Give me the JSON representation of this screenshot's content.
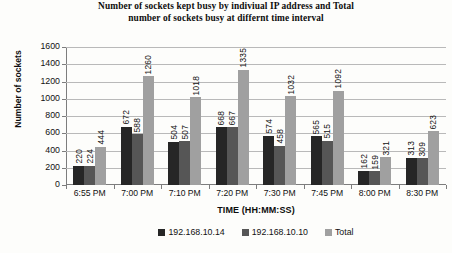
{
  "chart_data": {
    "type": "bar",
    "title": "Number of sockets kept busy by indiviual IP address and Total number of sockets busy at differnt time interval",
    "title_line1": "Number of sockets kept busy by indiviual IP address and Total",
    "title_line2": "number of sockets busy at differnt time interval",
    "xlabel": "TIME (HH:MM:SS)",
    "ylabel": "Number of sockets",
    "ylim": [
      0,
      1600
    ],
    "ytick_step": 200,
    "yticks": [
      "1600",
      "1400",
      "1200",
      "1000",
      "800",
      "600",
      "400",
      "200",
      "0"
    ],
    "grid": true,
    "legend_position": "bottom",
    "categories": [
      "6:55 PM",
      "7:00 PM",
      "7:10 PM",
      "7:20 PM",
      "7:30 PM",
      "7:45 PM",
      "8:00 PM",
      "8:30 PM"
    ],
    "series": [
      {
        "name": "192.168.10.14",
        "color": "#262626",
        "values": [
          220,
          672,
          504,
          668,
          574,
          565,
          162,
          313
        ]
      },
      {
        "name": "192.168.10.10",
        "color": "#565656",
        "values": [
          224,
          588,
          507,
          667,
          458,
          515,
          159,
          309
        ]
      },
      {
        "name": "Total",
        "color": "#a0a0a0",
        "values": [
          444,
          1260,
          1018,
          1335,
          1032,
          1092,
          321,
          623
        ]
      }
    ]
  }
}
